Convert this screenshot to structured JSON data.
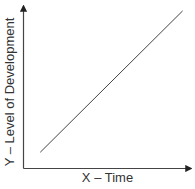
{
  "chart_data": {
    "type": "line",
    "title": "",
    "xlabel": "X – Time",
    "ylabel": "Y – Level of Development",
    "grid": false,
    "legend": null,
    "x_ticks": [],
    "y_ticks": [],
    "series": [
      {
        "name": "Level of Development",
        "x": [
          0.1,
          0.95
        ],
        "y": [
          0.1,
          0.97
        ]
      }
    ],
    "xlim": [
      0,
      1
    ],
    "ylim": [
      0,
      1
    ],
    "annotations": []
  },
  "colors": {
    "axis": "#333333",
    "line": "#444444",
    "text": "#333333"
  }
}
